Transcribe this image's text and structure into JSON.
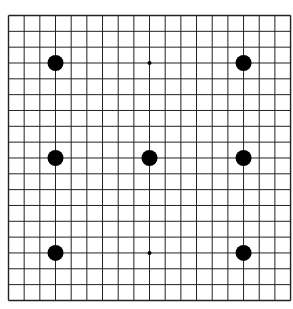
{
  "board": {
    "size": 19,
    "origin_x": 8.5,
    "origin_y": 15.5,
    "cell_w": 15.67,
    "cell_h": 15.83,
    "line_color": "#222222",
    "background": "#ffffff"
  },
  "stones": [
    {
      "col": 3,
      "row": 3,
      "color": "black",
      "r": 8
    },
    {
      "col": 15,
      "row": 3,
      "color": "black",
      "r": 8
    },
    {
      "col": 3,
      "row": 9,
      "color": "black",
      "r": 8
    },
    {
      "col": 9,
      "row": 9,
      "color": "black",
      "r": 8
    },
    {
      "col": 15,
      "row": 9,
      "color": "black",
      "r": 8
    },
    {
      "col": 3,
      "row": 15,
      "color": "black",
      "r": 8
    },
    {
      "col": 15,
      "row": 15,
      "color": "black",
      "r": 8
    }
  ],
  "markers": [
    {
      "col": 9,
      "row": 3,
      "r": 2
    },
    {
      "col": 9,
      "row": 15,
      "r": 2
    }
  ]
}
